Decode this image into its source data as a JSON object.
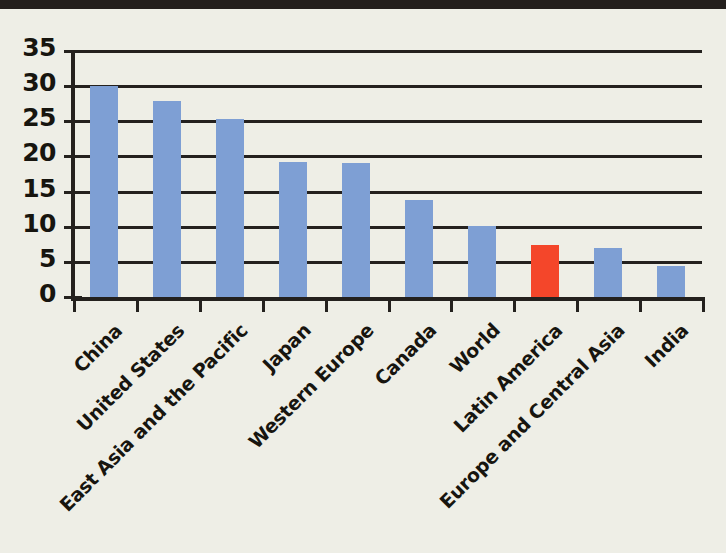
{
  "figure": {
    "kind": "scanned-bar-chart",
    "background_color": "#eeeee6",
    "scan_band_color": "#231f1c",
    "axis_color": "#24211e"
  },
  "chart_data": {
    "type": "bar",
    "title": "",
    "subtitle": "",
    "xlabel": "",
    "ylabel": "",
    "ylim": [
      0,
      35
    ],
    "yticks": [
      0,
      5,
      10,
      15,
      20,
      25,
      30,
      35
    ],
    "ytick_labels": [
      "0",
      "5",
      "10",
      "15",
      "20",
      "25",
      "30",
      "35"
    ],
    "grid": true,
    "grid_axis": "y",
    "legend": false,
    "legend_position": "none",
    "xtick_label_rotation": -45,
    "categories": [
      "China",
      "United States",
      "East Asia and the Pacific",
      "Japan",
      "Western Europe",
      "Canada",
      "World",
      "Latin America",
      "Europe and Central Asia",
      "India"
    ],
    "values": [
      30.0,
      27.9,
      25.3,
      19.2,
      19.0,
      13.8,
      10.1,
      7.4,
      7.0,
      4.4
    ],
    "bar_colors": [
      "#7e9fd4",
      "#7e9fd4",
      "#7e9fd4",
      "#7e9fd4",
      "#7e9fd4",
      "#7e9fd4",
      "#7e9fd4",
      "#f4462a",
      "#7e9fd4",
      "#7e9fd4"
    ],
    "highlight_category": "Latin America",
    "highlight_color": "#f4462a",
    "series_color": "#7e9fd4"
  }
}
